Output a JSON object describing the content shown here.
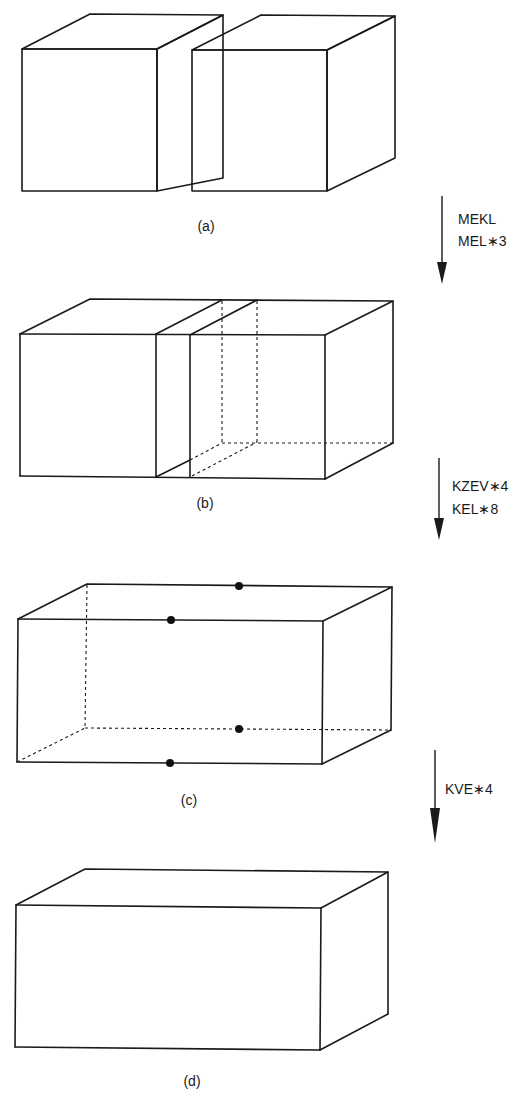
{
  "figure": {
    "background": "#ffffff",
    "line_color": "#1a1a1a",
    "stages": [
      {
        "id": "a",
        "label": "(a)",
        "description": "Two separate cubes side by side"
      },
      {
        "id": "b",
        "label": "(b)",
        "description": "Cubes joined into one solid with internal edges; hidden edges dashed"
      },
      {
        "id": "c",
        "label": "(c)",
        "description": "Single box with four vertices (dots) remaining on long edges"
      },
      {
        "id": "d",
        "label": "(d)",
        "description": "Final single rectangular box"
      }
    ],
    "transitions": [
      {
        "from": "a",
        "to": "b",
        "lines": [
          "MEKL",
          "MEL∗3"
        ]
      },
      {
        "from": "b",
        "to": "c",
        "lines": [
          "KZEV∗4",
          "KEL∗8"
        ]
      },
      {
        "from": "c",
        "to": "d",
        "lines": [
          "KVE∗4"
        ]
      }
    ],
    "icons": {
      "transition_arrow": "down-arrow-icon",
      "vertex_marker": "filled-dot-icon"
    }
  }
}
